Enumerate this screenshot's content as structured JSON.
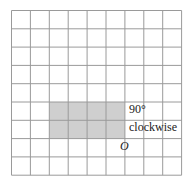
{
  "diagram": {
    "grid": {
      "cols": 9,
      "rows": 9,
      "x0": 11.5,
      "y0": 10.5,
      "cell_w": 18.9,
      "cell_h": 18.3,
      "line_color": "#9a9a9a"
    },
    "shape": {
      "col_start": 2,
      "col_end": 6,
      "row_start": 5,
      "row_end": 7,
      "fill": "#cfcfcf"
    },
    "rotation_label_line1": "90°",
    "rotation_label_line2": "clockwise",
    "center_label": "O"
  }
}
